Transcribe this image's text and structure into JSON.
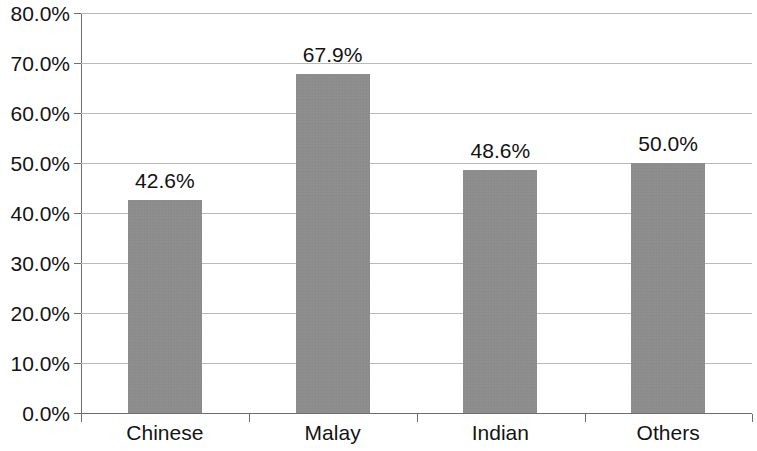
{
  "chart_data": {
    "type": "bar",
    "title": "",
    "subtitle": "",
    "xlabel": "",
    "ylabel": "",
    "categories": [
      "Chinese",
      "Malay",
      "Indian",
      "Others"
    ],
    "values": [
      42.6,
      67.9,
      48.6,
      50.0
    ],
    "value_labels": [
      "42.6%",
      "67.9%",
      "48.6%",
      "50.0%"
    ],
    "ylim": [
      0,
      80
    ],
    "ytick_values": [
      0,
      10,
      20,
      30,
      40,
      50,
      60,
      70,
      80
    ],
    "ytick_labels": [
      "0.0%",
      "10.0%",
      "20.0%",
      "30.0%",
      "40.0%",
      "50.0%",
      "60.0%",
      "70.0%",
      "80.0%"
    ],
    "grid": true,
    "legend": false,
    "legend_position": "none",
    "series": [
      {
        "name": "",
        "values": [
          42.6,
          67.9,
          48.6,
          50.0
        ],
        "color": "#8c8c8c"
      }
    ],
    "colors": {
      "bar_fill": "#8c8c8c",
      "gridline": "#b9b9b9",
      "axis": "#6e6e6e",
      "text": "#141414",
      "background": "#ffffff"
    }
  }
}
